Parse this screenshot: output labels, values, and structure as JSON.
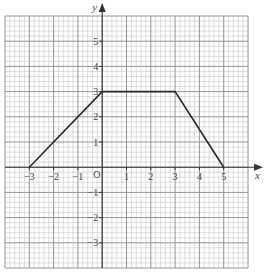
{
  "chart_data": {
    "type": "line",
    "title": "",
    "xlabel": "x",
    "ylabel": "y",
    "origin_label": "O",
    "xlim": [
      -4,
      6
    ],
    "ylim": [
      -4,
      6
    ],
    "grid": true,
    "minor_subdivisions": 5,
    "x_ticks": [
      -3,
      -2,
      -1,
      1,
      2,
      3,
      4,
      5
    ],
    "x_tick_labels": [
      "−3",
      "−2",
      "−1",
      "1",
      "2",
      "3",
      "4",
      "5"
    ],
    "y_ticks": [
      -3,
      -2,
      -1,
      1,
      2,
      3,
      4,
      5
    ],
    "y_tick_labels": [
      "−3",
      "−2",
      "−1",
      "1",
      "2",
      "3",
      "4",
      "5"
    ],
    "series": [
      {
        "name": "trapezium outline",
        "points": [
          [
            -3,
            0
          ],
          [
            0,
            3
          ],
          [
            3,
            3
          ],
          [
            5,
            0
          ]
        ],
        "color": "#2a2a2a"
      }
    ],
    "legend": null
  },
  "colors": {
    "minor_grid": "#c8c8c8",
    "major_grid": "#8a8a8a",
    "axis": "#333333",
    "line": "#2a2a2a"
  }
}
